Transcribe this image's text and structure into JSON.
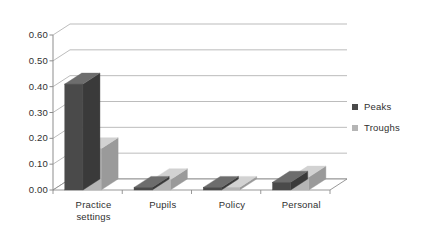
{
  "chart_data": {
    "type": "bar",
    "title": "",
    "subtitle": "",
    "xlabel": "",
    "ylabel": "",
    "categories": [
      "Practice settings",
      "Pupils",
      "Policy",
      "Personal"
    ],
    "category_lines": [
      [
        "Practice",
        "settings"
      ],
      [
        "Pupils"
      ],
      [
        "Policy"
      ],
      [
        "Personal"
      ]
    ],
    "series": [
      {
        "name": "Peaks",
        "values": [
          0.41,
          0.01,
          0.01,
          0.03
        ],
        "color": "#4a4a4a"
      },
      {
        "name": "Troughs",
        "values": [
          0.16,
          0.04,
          0.01,
          0.05
        ],
        "color": "#b5b5b5"
      }
    ],
    "ylim": [
      0.0,
      0.6
    ],
    "ytick_values": [
      0.0,
      0.1,
      0.2,
      0.3,
      0.4,
      0.5,
      0.6
    ],
    "ytick_labels": [
      "0.00",
      "0.10",
      "0.20",
      "0.30",
      "0.40",
      "0.50",
      "0.60"
    ],
    "grid": true,
    "grid_axis": "y",
    "legend_position": "right",
    "three_d": true,
    "style": {
      "gridline_color": "#9b9b9b",
      "axis_color": "#8d8d8d",
      "background": "#ffffff",
      "text_color": "#2f2f2f",
      "peaks_top": "#6d6d6d",
      "peaks_side": "#3a3a3a",
      "troughs_top": "#d2d2d2",
      "troughs_side": "#9a9a9a",
      "floor_fill": "#ffffff"
    }
  },
  "legend": {
    "items": [
      {
        "label": "Peaks",
        "color": "#4a4a4a"
      },
      {
        "label": "Troughs",
        "color": "#b5b5b5"
      }
    ]
  }
}
